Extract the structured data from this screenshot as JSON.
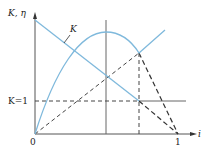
{
  "diagram": {
    "y_axis_label": "K, η",
    "x_axis_label": "i",
    "origin_label": "0",
    "x_tick_label": "1",
    "k1_label": "K=1",
    "curve_k_label": "K",
    "colors": {
      "curve": "#7fb9dc",
      "axis": "#555555",
      "dashed": "#444444"
    }
  }
}
